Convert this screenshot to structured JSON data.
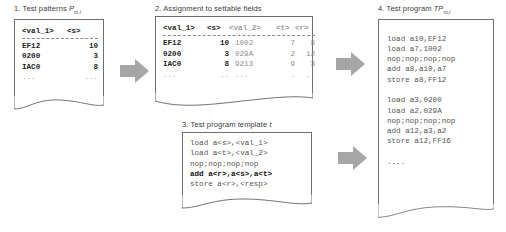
{
  "figure": {
    "background": "#ffffff",
    "arrow_color": "#9a9a9a",
    "ink_color": "#3a3a3a"
  },
  "panels": {
    "test_patterns": {
      "step": "1.",
      "title": "Test patterns",
      "symbol": "P",
      "subscript": "m,i",
      "columns": [
        "<val_1>",
        "<s>"
      ],
      "rows": [
        [
          "EF12",
          "10"
        ],
        [
          "0200",
          "3"
        ],
        [
          "IAC0",
          "8"
        ]
      ],
      "ellipsis": [
        "...",
        "..."
      ]
    },
    "assignment": {
      "step": "2.",
      "title": "Assignment to settable fields",
      "columns": [
        "<val_1>",
        "<s>",
        "<val_2>",
        "<t>",
        "<r>"
      ],
      "rows": [
        [
          "EF12",
          "10",
          "1002",
          "7",
          "8"
        ],
        [
          "0200",
          "3",
          "029A",
          "2",
          "12"
        ],
        [
          "IAC0",
          "8",
          "9213",
          "9",
          "3"
        ]
      ],
      "ellipsis": [
        "...",
        "..",
        "...",
        ".",
        ".."
      ]
    },
    "template": {
      "step": "3.",
      "title": "Test program template",
      "symbol": "t",
      "lines": [
        {
          "text": "load a<s>,<val_1>",
          "bold": false
        },
        {
          "text": "load a<t>,<val_2>",
          "bold": false
        },
        {
          "text": "nop;nop;nop;nop",
          "bold": false
        },
        {
          "text": "add a<r>,a<s>,a<t>",
          "bold": true
        },
        {
          "text": "store a<r>,<resp>",
          "bold": false
        }
      ]
    },
    "test_program": {
      "step": "4.",
      "title": "Test program",
      "symbol": "TP",
      "subscript": "m,i",
      "lines": [
        {
          "text": "load a10,EF12",
          "bold": false
        },
        {
          "text": "load a7,1002",
          "bold": false
        },
        {
          "text": "nop;nop;nop;nop",
          "bold": false
        },
        {
          "text": "add a8,a10,a7",
          "bold": false
        },
        {
          "text": "store a8,FF12",
          "bold": false
        },
        {
          "text": "",
          "bold": false
        },
        {
          "text": "load a3,0200",
          "bold": false
        },
        {
          "text": "load a2,029A",
          "bold": false
        },
        {
          "text": "nop;nop;nop;nop",
          "bold": false
        },
        {
          "text": "add a12,a3,a2",
          "bold": false
        },
        {
          "text": "store a12,FF16",
          "bold": false
        },
        {
          "text": "",
          "bold": false
        },
        {
          "text": "....",
          "bold": false
        }
      ]
    }
  },
  "arrows": {
    "patterns_to_assignment": "arrow-right",
    "assignment_to_program": "arrow-right",
    "template_to_program": "arrow-right"
  }
}
